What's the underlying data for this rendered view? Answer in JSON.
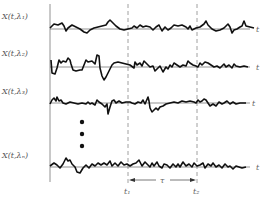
{
  "figure": {
    "rows": [
      {
        "label": "X(t,λ₁)",
        "axis_label": "t",
        "baseline_y": 29
      },
      {
        "label": "X(t,λ₂)",
        "axis_label": "t",
        "baseline_y": 67
      },
      {
        "label": "X(t,λ₃)",
        "axis_label": "t",
        "baseline_y": 103
      },
      {
        "label": "X(t,λₙ)",
        "axis_label": "t",
        "baseline_y": 167
      }
    ],
    "ellipsis": "•••",
    "markers": {
      "t1": {
        "label": "t₁",
        "x": 128
      },
      "t2": {
        "label": "t₂",
        "x": 197
      },
      "interval": {
        "label": "τ"
      }
    },
    "colors": {
      "signal": "#111111",
      "axis": "#777777",
      "dashed": "#888888",
      "label": "#555555"
    }
  }
}
